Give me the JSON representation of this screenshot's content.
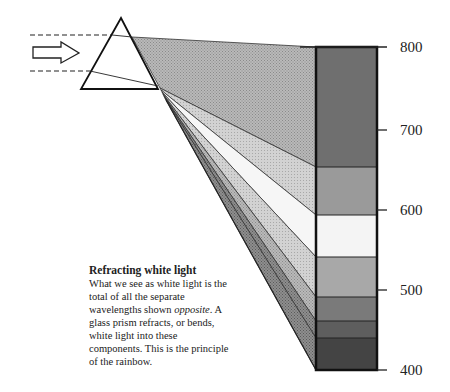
{
  "diagram": {
    "title": "Refracting white light",
    "caption": {
      "before_italic": "What we see as white light is the total of all the separate wavelengths shown ",
      "italic": "opposite",
      "after_italic": ". A glass prism refracts, or bends, white light into these components. This is the principle of the rainbow."
    },
    "axis": {
      "ticks": [
        "800",
        "700",
        "600",
        "500",
        "400"
      ]
    },
    "elements": {
      "incoming_light_arrow": "white-light-arrow",
      "prism": "glass-prism",
      "spectrum_bar": "wavelength-bar"
    },
    "bands": [
      {
        "name": "red",
        "from": 800,
        "to": 650,
        "fill": "#6f6f6f"
      },
      {
        "name": "orange",
        "from": 650,
        "to": 590,
        "fill": "#9a9a9a"
      },
      {
        "name": "yellow",
        "from": 590,
        "to": 540,
        "fill": "#f4f4f4"
      },
      {
        "name": "green",
        "from": 540,
        "to": 490,
        "fill": "#a8a8a8"
      },
      {
        "name": "blue",
        "from": 490,
        "to": 460,
        "fill": "#7a7a7a"
      },
      {
        "name": "indigo",
        "from": 460,
        "to": 440,
        "fill": "#5e5e5e"
      },
      {
        "name": "violet",
        "from": 440,
        "to": 400,
        "fill": "#444444"
      }
    ]
  }
}
